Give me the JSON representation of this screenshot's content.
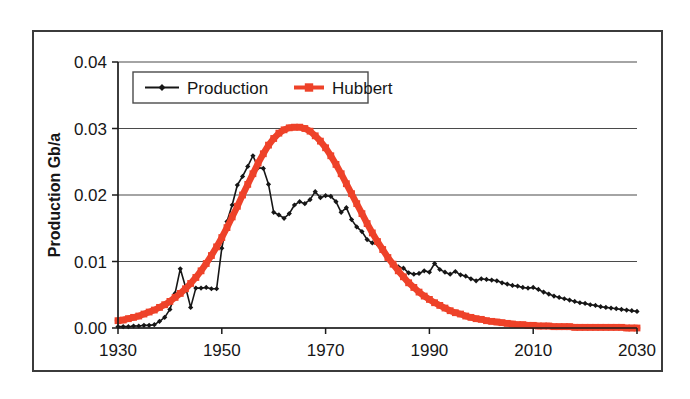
{
  "figure": {
    "name": "production-hubbert-chart",
    "frame_color": "#3b3b3b",
    "background": "#ffffff"
  },
  "chart_data": {
    "type": "line",
    "title": "",
    "subtitle": "",
    "xlabel": "",
    "ylabel": "Production Gb/a",
    "xlim": [
      1930,
      2030
    ],
    "ylim": [
      0.0,
      0.04
    ],
    "grid": true,
    "grid_axis": "y",
    "legend_position": "top-left-inside",
    "x_ticks": [
      1930,
      1950,
      1970,
      1990,
      2010,
      2030
    ],
    "x_tick_labels": [
      "1930",
      "1950",
      "1970",
      "1990",
      "2010",
      "2030"
    ],
    "y_ticks": [
      0.0,
      0.01,
      0.02,
      0.03,
      0.04
    ],
    "y_tick_labels": [
      "0.00",
      "0.01",
      "0.02",
      "0.03",
      "0.04"
    ],
    "x": [
      1930,
      1931,
      1932,
      1933,
      1934,
      1935,
      1936,
      1937,
      1938,
      1939,
      1940,
      1941,
      1942,
      1943,
      1944,
      1945,
      1946,
      1947,
      1948,
      1949,
      1950,
      1951,
      1952,
      1953,
      1954,
      1955,
      1956,
      1957,
      1958,
      1959,
      1960,
      1961,
      1962,
      1963,
      1964,
      1965,
      1966,
      1967,
      1968,
      1969,
      1970,
      1971,
      1972,
      1973,
      1974,
      1975,
      1976,
      1977,
      1978,
      1979,
      1980,
      1981,
      1982,
      1983,
      1984,
      1985,
      1986,
      1987,
      1988,
      1989,
      1990,
      1991,
      1992,
      1993,
      1994,
      1995,
      1996,
      1997,
      1998,
      1999,
      2000,
      2001,
      2002,
      2003,
      2004,
      2005,
      2006,
      2007,
      2008,
      2009,
      2010,
      2011,
      2012,
      2013,
      2014,
      2015,
      2016,
      2017,
      2018,
      2019,
      2020,
      2021,
      2022,
      2023,
      2024,
      2025,
      2026,
      2027,
      2028,
      2029,
      2030
    ],
    "series": [
      {
        "name": "Production",
        "color": "#161616",
        "marker": "diamond",
        "marker_color": "#161616",
        "line_width": 1.6,
        "values": [
          0.0002,
          0.0002,
          0.0002,
          0.0003,
          0.0003,
          0.0004,
          0.0004,
          0.0005,
          0.001,
          0.0016,
          0.0028,
          0.0052,
          0.0089,
          0.0062,
          0.0031,
          0.006,
          0.006,
          0.0061,
          0.0059,
          0.0059,
          0.012,
          0.016,
          0.0185,
          0.0215,
          0.0228,
          0.0243,
          0.0259,
          0.0241,
          0.024,
          0.0216,
          0.0174,
          0.017,
          0.0165,
          0.0172,
          0.0185,
          0.019,
          0.0187,
          0.0193,
          0.0205,
          0.0196,
          0.0199,
          0.0198,
          0.019,
          0.0174,
          0.0181,
          0.0163,
          0.0152,
          0.0145,
          0.0133,
          0.0128,
          0.0126,
          0.0115,
          0.0103,
          0.0096,
          0.0092,
          0.009,
          0.0083,
          0.0081,
          0.0082,
          0.0086,
          0.0084,
          0.0097,
          0.0088,
          0.0084,
          0.0081,
          0.0085,
          0.008,
          0.0078,
          0.0074,
          0.0071,
          0.0074,
          0.0073,
          0.0072,
          0.0071,
          0.0068,
          0.0066,
          0.0064,
          0.0063,
          0.0061,
          0.006,
          0.0061,
          0.0058,
          0.0054,
          0.0051,
          0.0048,
          0.0046,
          0.0044,
          0.0042,
          0.004,
          0.0038,
          0.0037,
          0.0035,
          0.0034,
          0.0032,
          0.0031,
          0.003,
          0.0029,
          0.0028,
          0.0027,
          0.0026,
          0.0025
        ]
      },
      {
        "name": "Hubbert",
        "color": "#EE4229",
        "marker": "square",
        "marker_color": "#EE4229",
        "line_width": 6.5,
        "values": [
          0.0011,
          0.0012,
          0.0014,
          0.0016,
          0.0018,
          0.0021,
          0.0024,
          0.0027,
          0.0031,
          0.0035,
          0.004,
          0.0046,
          0.0052,
          0.0059,
          0.0067,
          0.0076,
          0.0086,
          0.0097,
          0.0109,
          0.0122,
          0.0136,
          0.0151,
          0.0167,
          0.0183,
          0.02,
          0.0216,
          0.0232,
          0.0248,
          0.0262,
          0.0275,
          0.0285,
          0.0293,
          0.0298,
          0.0301,
          0.0302,
          0.0302,
          0.03,
          0.0296,
          0.0289,
          0.0281,
          0.0271,
          0.0259,
          0.0246,
          0.0232,
          0.0217,
          0.0202,
          0.0187,
          0.0172,
          0.0157,
          0.0143,
          0.013,
          0.0118,
          0.0106,
          0.0096,
          0.0086,
          0.0077,
          0.0068,
          0.0061,
          0.0054,
          0.0048,
          0.0043,
          0.0038,
          0.0034,
          0.003,
          0.0026,
          0.0023,
          0.0021,
          0.0018,
          0.0016,
          0.0014,
          0.0013,
          0.0011,
          0.001,
          0.0009,
          0.0008,
          0.0007,
          0.0006,
          0.0005,
          0.0005,
          0.0004,
          0.0004,
          0.0003,
          0.0003,
          0.0003,
          0.0002,
          0.0002,
          0.0002,
          0.0002,
          0.0001,
          0.0001,
          0.0001,
          0.0001,
          0.0001,
          0.0001,
          0.0001,
          0.0001,
          0.0001,
          0.0001,
          0.0,
          0.0,
          0.0
        ]
      }
    ],
    "annotations": []
  },
  "legend": {
    "entries": [
      {
        "label": "Production",
        "color": "#161616",
        "marker": "diamond"
      },
      {
        "label": "Hubbert",
        "color": "#EE4229",
        "marker": "square"
      }
    ]
  },
  "axis": {
    "y_title": "Production Gb/a"
  }
}
